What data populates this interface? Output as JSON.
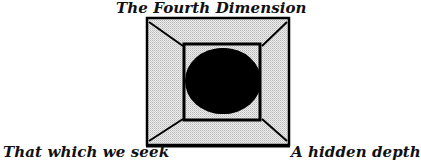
{
  "diagram": {
    "title": "The Fourth Dimension",
    "labels": {
      "bottom_left": "That which we seek",
      "bottom_right": "A hidden depth"
    },
    "shapes": {
      "outer_square": {
        "x": 146,
        "y": 17,
        "width": 144,
        "height": 129,
        "fill": "#d9d9d9",
        "stroke": "#000000"
      },
      "inner_square": {
        "x": 184,
        "y": 44,
        "width": 76,
        "height": 76,
        "stroke": "#000000"
      },
      "sphere": {
        "cx": 221,
        "cy": 81,
        "rx": 37,
        "ry": 33,
        "fill": "#000000"
      }
    }
  }
}
